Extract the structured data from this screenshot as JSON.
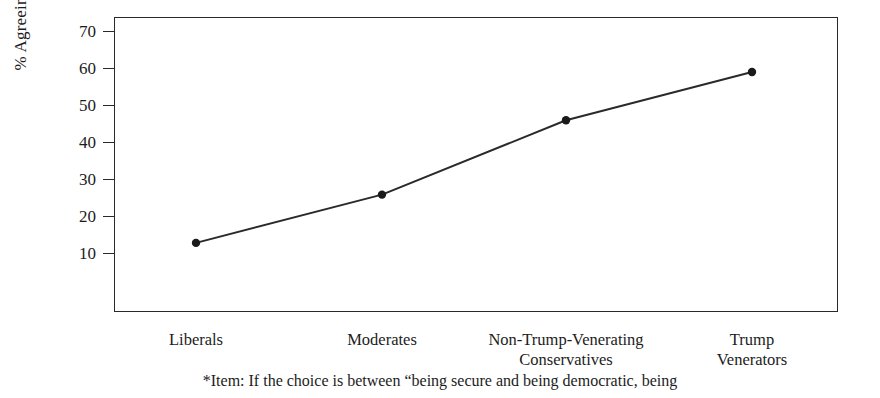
{
  "chart_data": {
    "type": "line",
    "title": "",
    "subtitle": "",
    "xlabel": "",
    "ylabel": "% Agreeing",
    "categories": [
      "Liberals",
      "Non-Trump-Venerating\nConservatives",
      "Moderates",
      "Trump\nVenerators"
    ],
    "x_categories": [
      "Liberals",
      "Moderates",
      "Non-Trump-Venerating\nConservatives",
      "Trump\nVenerators"
    ],
    "values": [
      13,
      26,
      46,
      59
    ],
    "series": [
      {
        "name": "% Agreeing",
        "values": [
          13,
          26,
          46,
          59
        ]
      }
    ],
    "points": [
      {
        "category": "Liberals",
        "value": 13
      },
      {
        "category": "Moderates",
        "value": 26
      },
      {
        "category": "Non-Trump-Venerating Conservatives",
        "value": 46
      },
      {
        "category": "Trump Venerators",
        "value": 59
      }
    ],
    "ylim": [
      3,
      76
    ],
    "yticks": [
      70,
      60,
      50,
      40,
      30,
      20,
      10
    ],
    "ytick_labels": [
      "70",
      "60",
      "50",
      "40",
      "30",
      "20",
      "10"
    ],
    "grid": false,
    "legend": false,
    "legend_position": "none",
    "marker": "filled-circle",
    "line_color": "#2a2a2a",
    "marker_color": "#1a1a1a",
    "axis_color": "#2a2a2a",
    "background_color": "#ffffff"
  },
  "axis": {
    "y_title": "% Agreeing",
    "ticks": [
      {
        "label": "70",
        "value": 70
      },
      {
        "label": "60",
        "value": 60
      },
      {
        "label": "50",
        "value": 50
      },
      {
        "label": "40",
        "value": 40
      },
      {
        "label": "30",
        "value": 30
      },
      {
        "label": "20",
        "value": 20
      },
      {
        "label": "10",
        "value": 10
      }
    ],
    "x_labels": [
      "Liberals",
      "Moderates",
      "Non-Trump-Venerating\nConservatives",
      "Trump\nVenerators"
    ]
  },
  "footnote": {
    "text": "*Item: If the choice is between “being secure and being democratic, being"
  }
}
